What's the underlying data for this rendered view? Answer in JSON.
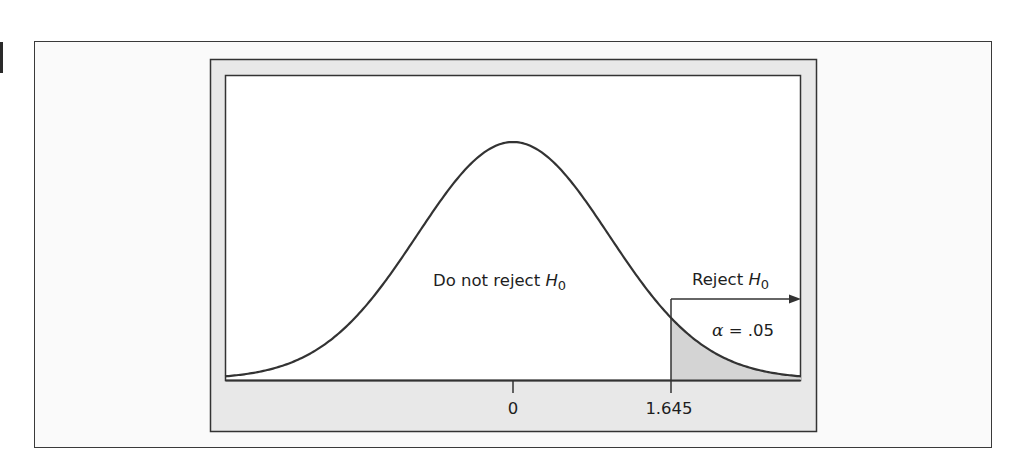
{
  "chart_data": {
    "type": "area",
    "title": "",
    "subtitle": "",
    "xlabel": "",
    "ylabel": "",
    "xlim": [
      -3,
      3
    ],
    "ylim": [
      0,
      0.4
    ],
    "grid": false,
    "legend": null,
    "curve": {
      "distribution": "standard normal",
      "mean": 0,
      "sd": 1,
      "peak_density": 0.399
    },
    "tick_labels": [
      "0",
      "1.645"
    ],
    "ticks": [
      0,
      1.645
    ],
    "critical_value": 1.645,
    "shaded_region": {
      "from": 1.645,
      "to": 3,
      "label": "α = .05",
      "alpha": 0.05
    },
    "annotations": [
      {
        "text": "Do not reject H0",
        "position": "center, below peak"
      },
      {
        "text": "Reject H0",
        "position": "right of critical value, above arrow"
      },
      {
        "text": "α = .05",
        "position": "inside shaded right tail"
      }
    ]
  },
  "labels": {
    "do_not_reject": "Do not reject ",
    "reject": "Reject ",
    "hyp_letter": "H",
    "hyp_sub": "0",
    "alpha_symbol": "α",
    "alpha_eq": " = .05",
    "tick_zero": "0",
    "tick_critical": "1.645"
  },
  "colors": {
    "frame_fill": "#e8e8e8",
    "tail_fill": "#d4d4d4",
    "plot_fill": "#ffffff",
    "line": "#333333"
  }
}
